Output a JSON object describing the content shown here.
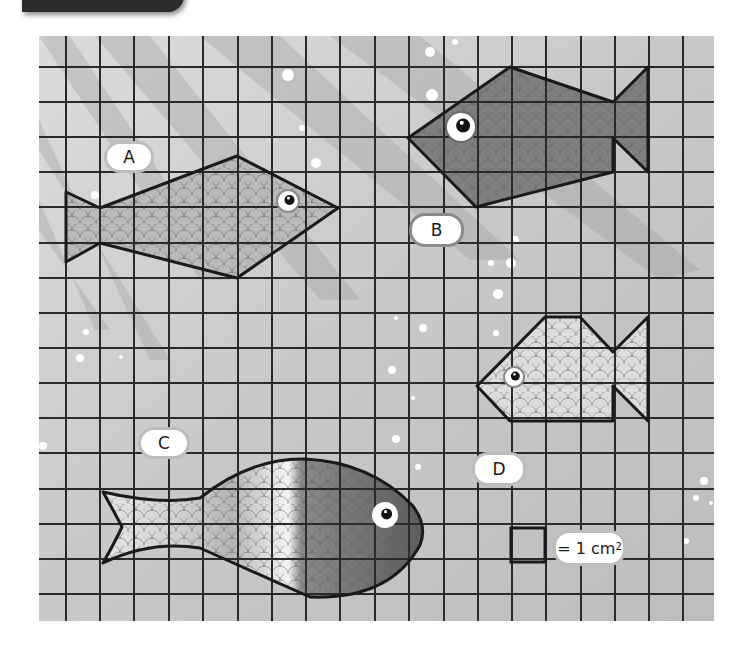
{
  "figure": {
    "grid": {
      "left": 39,
      "top": 36,
      "right": 714,
      "bottom": 621,
      "vertical_lines": [
        66,
        100,
        134,
        169,
        203,
        238,
        272,
        306,
        340,
        375,
        409,
        444,
        478,
        512,
        546,
        581,
        615,
        649,
        683
      ],
      "horizontal_lines": [
        67,
        102,
        137,
        172,
        207,
        243,
        278,
        313,
        348,
        383,
        418,
        453,
        489,
        524,
        559,
        594
      ],
      "background_color": "#c9c9c9",
      "line_color": "#2a2a2a"
    },
    "fish": [
      {
        "id": "A",
        "label": "A",
        "shape": "polygon",
        "points": "66,192 100,208 237,156 338,208 237,278 100,243 66,262",
        "fill": "#b9b9b9",
        "eye": {
          "cx": 288,
          "cy": 201,
          "r": 10,
          "ring": "#8a8a8a"
        },
        "label_box": {
          "x": 104,
          "y": 141,
          "w": 50,
          "h": 32
        }
      },
      {
        "id": "B",
        "label": "B",
        "shape": "polygon",
        "points": "408,138 510,67 613,102 648,67 648,172 613,138 613,172 476,207",
        "fill": "#7f7f7f",
        "eye": {
          "cx": 461,
          "cy": 127,
          "r": 14,
          "ring": "#6a6a6a"
        },
        "label_box": {
          "x": 409,
          "y": 213,
          "w": 55,
          "h": 34
        }
      },
      {
        "id": "C",
        "label": "C",
        "shape": "curve",
        "path": "M103,492 Q116,515 122,527 Q116,540 103,563 Q150,540 200,548 Q260,575 310,597 Q390,600 420,545 Q428,525 412,505 Q370,462 305,459 Q250,458 200,498 Q160,505 103,492 Z",
        "fill_gradient": [
          "#e4e4e4",
          "#cfcfcf",
          "#b0b0b0",
          "#ffffff",
          "#7a7a7a",
          "#5e5e5e"
        ],
        "eye": {
          "cx": 385,
          "cy": 515,
          "r": 11,
          "ring": "#ffffff"
        },
        "label_box": {
          "x": 138,
          "y": 427,
          "w": 52,
          "h": 32
        }
      },
      {
        "id": "D",
        "label": "D",
        "shape": "polygon",
        "points": "477,386 545,317 580,317 613,352 648,317 648,421 613,386 613,421 510,421",
        "fill": "#dcdcdc",
        "eye": {
          "cx": 514,
          "cy": 377,
          "r": 9,
          "ring": "#8a8a8a"
        },
        "label_box": {
          "x": 472,
          "y": 452,
          "w": 54,
          "h": 34
        }
      }
    ],
    "legend": {
      "square": {
        "x": 511,
        "y": 528,
        "size": 34
      },
      "text_prefix": "= 1 cm",
      "text_superscript": "2",
      "box": {
        "x": 553,
        "y": 530,
        "w": 73,
        "h": 36
      }
    },
    "bubbles": [
      [
        430,
        52,
        5
      ],
      [
        455,
        42,
        3
      ],
      [
        288,
        75,
        6
      ],
      [
        432,
        95,
        6
      ],
      [
        302,
        128,
        3
      ],
      [
        316,
        163,
        5
      ],
      [
        297,
        229,
        4
      ],
      [
        515,
        240,
        4
      ],
      [
        491,
        263,
        3
      ],
      [
        511,
        263,
        5
      ],
      [
        498,
        294,
        5
      ],
      [
        423,
        328,
        4
      ],
      [
        396,
        318,
        2
      ],
      [
        496,
        333,
        3
      ],
      [
        392,
        370,
        4
      ],
      [
        413,
        398,
        2
      ],
      [
        396,
        439,
        4
      ],
      [
        418,
        467,
        3
      ],
      [
        86,
        332,
        3
      ],
      [
        80,
        358,
        4
      ],
      [
        121,
        357,
        2
      ],
      [
        43,
        446,
        4
      ],
      [
        704,
        481,
        4
      ],
      [
        696,
        498,
        3
      ],
      [
        711,
        503,
        2
      ],
      [
        686,
        541,
        3
      ],
      [
        95,
        195,
        4
      ]
    ],
    "light_rays": [
      "39,36 70,36 230,280 200,280",
      "95,36 150,36 360,300 320,300",
      "200,36 280,36 520,260 470,260",
      "39,120 39,150 170,360 150,360",
      "330,36 420,36 700,270 660,280",
      "39,200 39,230 110,330 95,330"
    ]
  },
  "labels": {
    "A": "A",
    "B": "B",
    "C": "C",
    "D": "D",
    "unit_prefix": "= 1 cm",
    "unit_superscript": "2"
  }
}
